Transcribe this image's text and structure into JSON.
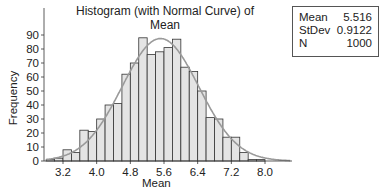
{
  "chart_data": {
    "type": "bar",
    "title": "Histogram (with Normal Curve) of Mean",
    "xlabel": "Mean",
    "ylabel": "Frequency",
    "x_ticks": [
      "3.2",
      "4.0",
      "4.8",
      "5.6",
      "6.4",
      "7.2",
      "8.0"
    ],
    "y_ticks": [
      0,
      10,
      20,
      30,
      40,
      50,
      60,
      70,
      80,
      90
    ],
    "ylim": [
      0,
      95
    ],
    "bin_width": 0.2,
    "bin_starts": [
      2.8,
      3.0,
      3.2,
      3.4,
      3.6,
      3.8,
      4.0,
      4.2,
      4.4,
      4.6,
      4.8,
      5.0,
      5.2,
      5.4,
      5.6,
      5.8,
      6.0,
      6.2,
      6.4,
      6.6,
      6.8,
      7.0,
      7.2,
      7.4,
      7.6,
      7.8,
      8.0,
      8.2
    ],
    "values": [
      1,
      2,
      8,
      6,
      22,
      21,
      30,
      40,
      41,
      62,
      70,
      88,
      76,
      78,
      81,
      87,
      67,
      64,
      50,
      31,
      30,
      17,
      17,
      6,
      1,
      1,
      0,
      0
    ],
    "normal_curve": {
      "mean": 5.516,
      "stdev": 0.9122,
      "n": 1000
    },
    "grid": false,
    "legend_position": "top-right stats box"
  },
  "stats": {
    "mean_label": "Mean",
    "mean_value": "5.516",
    "stdev_label": "StDev",
    "stdev_value": "0.9122",
    "n_label": "N",
    "n_value": "1000"
  },
  "colors": {
    "bar_fill": "#e4e4e4",
    "bar_edge": "#333333",
    "curve": "#9a9a9a",
    "axis": "#333333"
  }
}
